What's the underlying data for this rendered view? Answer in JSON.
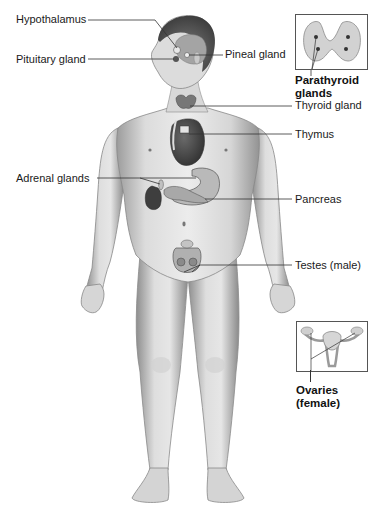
{
  "figure": {
    "labels": {
      "hypothalamus": "Hypothalamus",
      "pituitary": "Pituitary gland",
      "pineal": "Pineal gland",
      "parathyroid_line1": "Parathyroid",
      "parathyroid_line2": "glands",
      "thyroid": "Thyroid gland",
      "thymus": "Thymus",
      "adrenal": "Adrenal glands",
      "pancreas": "Pancreas",
      "testes": "Testes (male)",
      "ovaries_line1": "Ovaries",
      "ovaries_line2": "(female)"
    },
    "insets": [
      {
        "name": "parathyroid-inset",
        "depicts": "Thyroid (posterior view) with parathyroid glands"
      },
      {
        "name": "ovaries-inset",
        "depicts": "Uterus with ovaries"
      }
    ],
    "colors": {
      "skin_light": "#e4e4e4",
      "skin_mid": "#c8c8c8",
      "skin_dark": "#8f8f8f",
      "organ_dark": "#4a4a4a",
      "leader_line": "#333333",
      "text": "#1a1a1a"
    }
  }
}
